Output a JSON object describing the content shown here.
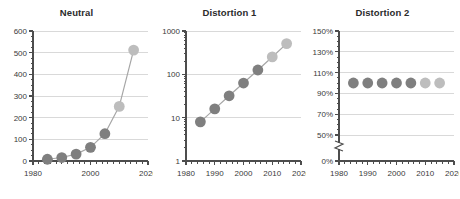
{
  "figure": {
    "background": "#ffffff",
    "dot_color_dark": "#7f7f7f",
    "dot_color_light": "#bdbdbd",
    "line_color": "#a6a6a6",
    "grid_color": "#d9d9d9",
    "axis_color": "#4d4d4d",
    "text_color": "#3a3a3a"
  },
  "panels": [
    {
      "id": "neutral",
      "title": "Neutral"
    },
    {
      "id": "distortion-1",
      "title": "Distortion 1"
    },
    {
      "id": "distortion-2",
      "title": "Distortion 2"
    }
  ],
  "chart_data": [
    {
      "type": "scatter",
      "title": "Neutral",
      "xlabel": "",
      "ylabel": "",
      "scale": "linear",
      "x": [
        1985,
        1990,
        1995,
        2000,
        2005,
        2010,
        2015
      ],
      "values": [
        8,
        16,
        32,
        63,
        126,
        252,
        512
      ],
      "point_colors": [
        "#7f7f7f",
        "#7f7f7f",
        "#7f7f7f",
        "#7f7f7f",
        "#7f7f7f",
        "#bdbdbd",
        "#bdbdbd"
      ],
      "connected": true,
      "xlim": [
        1980,
        2020
      ],
      "ylim": [
        0,
        600
      ],
      "xticks": [
        1980,
        2000,
        2020
      ],
      "xticklabels": [
        "1980",
        "2000",
        "2020"
      ],
      "yticks": [
        0,
        100,
        200,
        300,
        400,
        500,
        600
      ],
      "yticklabels": [
        "0",
        "100",
        "200",
        "300",
        "400",
        "500",
        "600"
      ],
      "grid": "horizontal",
      "axis_break": false,
      "minor_ticks": true
    },
    {
      "type": "scatter",
      "title": "Distortion 1",
      "xlabel": "",
      "ylabel": "",
      "scale": "log",
      "x": [
        1985,
        1990,
        1995,
        2000,
        2005,
        2010,
        2015
      ],
      "values": [
        8,
        16,
        32,
        63,
        126,
        252,
        512
      ],
      "point_colors": [
        "#7f7f7f",
        "#7f7f7f",
        "#7f7f7f",
        "#7f7f7f",
        "#7f7f7f",
        "#bdbdbd",
        "#bdbdbd"
      ],
      "connected": true,
      "xlim": [
        1980,
        2020
      ],
      "ylim": [
        1,
        1000
      ],
      "xticks": [
        1980,
        1990,
        2000,
        2010,
        2020
      ],
      "xticklabels": [
        "1980",
        "1990",
        "2000",
        "2010",
        "2020"
      ],
      "yticks": [
        1,
        10,
        100,
        1000
      ],
      "yticklabels": [
        "1",
        "10",
        "100",
        "1000"
      ],
      "grid": "horizontal",
      "axis_break": false,
      "minor_ticks": true
    },
    {
      "type": "scatter",
      "title": "Distortion 2",
      "xlabel": "",
      "ylabel": "",
      "scale": "linear",
      "x": [
        1985,
        1990,
        1995,
        2000,
        2005,
        2010,
        2015
      ],
      "values": [
        100,
        100,
        100,
        100,
        100,
        100,
        100
      ],
      "point_colors": [
        "#7f7f7f",
        "#7f7f7f",
        "#7f7f7f",
        "#7f7f7f",
        "#7f7f7f",
        "#bdbdbd",
        "#bdbdbd"
      ],
      "connected": false,
      "xlim": [
        1980,
        2020
      ],
      "ylim": [
        0,
        150
      ],
      "xticks": [
        1980,
        1990,
        2000,
        2010,
        2020
      ],
      "xticklabels": [
        "1980",
        "1990",
        "2000",
        "2010",
        "2020"
      ],
      "yticks": [
        0,
        50,
        70,
        90,
        110,
        130,
        150
      ],
      "yticklabels": [
        "0%",
        "50%",
        "70%",
        "90%",
        "110%",
        "130%",
        "150%"
      ],
      "grid": "horizontal",
      "axis_break": true,
      "axis_break_between": [
        0,
        50
      ],
      "minor_ticks": true
    }
  ]
}
